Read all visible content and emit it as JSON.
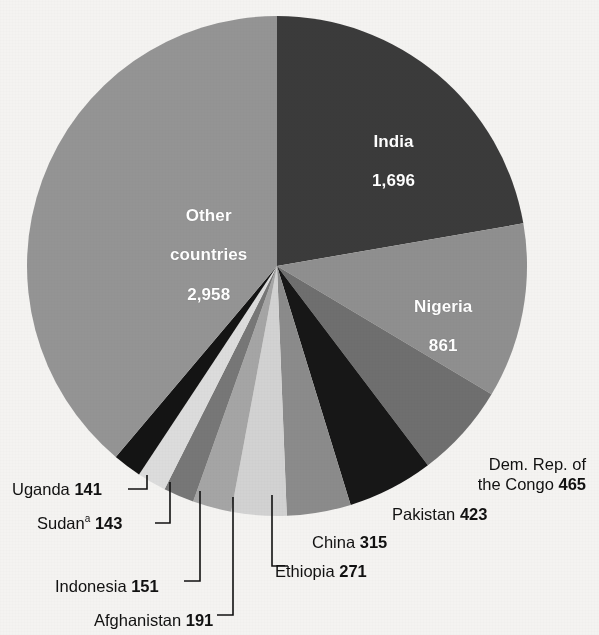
{
  "chart_data": {
    "type": "pie",
    "title": "",
    "subtitle": "",
    "unit": "",
    "total": 7615,
    "start_angle_deg": 0,
    "direction": "clockwise",
    "legend": "none",
    "labels_inside": [
      "India",
      "Nigeria",
      "Other countries"
    ],
    "categories": [
      "India",
      "Nigeria",
      "Dem. Rep. of the Congo",
      "Pakistan",
      "China",
      "Ethiopia",
      "Afghanistan",
      "Indonesia",
      "Sudan",
      "Uganda",
      "Other countries"
    ],
    "values": [
      1696,
      861,
      465,
      423,
      315,
      271,
      191,
      151,
      143,
      141,
      2958
    ],
    "slices": [
      {
        "id": "india",
        "name": "India",
        "value": 1696,
        "value_text": "1,696",
        "label_lines": [
          "India",
          "1,696"
        ],
        "color": "#3b3b3b",
        "label_placement": "inside",
        "label_color": "#ffffff",
        "label_x": 372,
        "label_y": 112,
        "angle_deg": 80.2
      },
      {
        "id": "nigeria",
        "name": "Nigeria",
        "value": 861,
        "value_text": "861",
        "label_lines": [
          "Nigeria",
          "861"
        ],
        "color": "#8f8f8f",
        "label_placement": "inside",
        "label_color": "#ffffff",
        "label_x": 414,
        "label_y": 277,
        "angle_deg": 40.7
      },
      {
        "id": "congo",
        "name": "Dem. Rep. of the Congo",
        "value": 465,
        "value_text": "465",
        "label_lines": [
          "Dem. Rep. of",
          "the Congo 465"
        ],
        "color": "#6f6f6f",
        "label_placement": "outside",
        "label_color": "#111111",
        "label_x": 456,
        "label_y": 455,
        "leader": false,
        "angle_deg": 22.0
      },
      {
        "id": "pakistan",
        "name": "Pakistan",
        "value": 423,
        "value_text": "423",
        "label_lines": [
          "Pakistan 423"
        ],
        "color": "#171717",
        "label_placement": "outside",
        "label_color": "#111111",
        "label_x": 392,
        "label_y": 505,
        "leader": false,
        "angle_deg": 20.0
      },
      {
        "id": "china",
        "name": "China",
        "value": 315,
        "value_text": "315",
        "label_lines": [
          "China 315"
        ],
        "color": "#8b8b8b",
        "label_placement": "outside",
        "label_color": "#111111",
        "label_x": 312,
        "label_y": 533,
        "leader": false,
        "angle_deg": 14.9
      },
      {
        "id": "ethiopia",
        "name": "Ethiopia",
        "value": 271,
        "value_text": "271",
        "label_lines": [
          "Ethiopia 271"
        ],
        "color": "#d2d2d2",
        "label_placement": "outside",
        "label_color": "#111111",
        "label_x": 275,
        "label_y": 562,
        "leader": true,
        "angle_deg": 12.8
      },
      {
        "id": "afghanistan",
        "name": "Afghanistan",
        "value": 191,
        "value_text": "191",
        "label_lines": [
          "Afghanistan 191"
        ],
        "color": "#a5a5a5",
        "label_placement": "outside",
        "label_color": "#111111",
        "label_x": 94,
        "label_y": 611,
        "leader": true,
        "angle_deg": 9.0
      },
      {
        "id": "indonesia",
        "name": "Indonesia",
        "value": 151,
        "value_text": "151",
        "label_lines": [
          "Indonesia 151"
        ],
        "color": "#777777",
        "label_placement": "outside",
        "label_color": "#111111",
        "label_x": 55,
        "label_y": 577,
        "leader": true,
        "angle_deg": 7.1
      },
      {
        "id": "sudan",
        "name": "Sudan",
        "name_superscript": "a",
        "value": 143,
        "value_text": "143",
        "label_lines": [
          "Sudan 143"
        ],
        "color": "#dcdcdc",
        "label_placement": "outside",
        "label_color": "#111111",
        "label_x": 37,
        "label_y": 513,
        "leader": true,
        "angle_deg": 6.8
      },
      {
        "id": "uganda",
        "name": "Uganda",
        "value": 141,
        "value_text": "141",
        "label_lines": [
          "Uganda 141"
        ],
        "color": "#141414",
        "label_placement": "outside",
        "label_color": "#111111",
        "label_x": 12,
        "label_y": 480,
        "leader": true,
        "angle_deg": 6.7
      },
      {
        "id": "other-countries",
        "name": "Other countries",
        "value": 2958,
        "value_text": "2,958",
        "label_lines": [
          "Other",
          "countries",
          "2,958"
        ],
        "color": "#949494",
        "label_placement": "inside",
        "label_color": "#ffffff",
        "label_x": 170,
        "label_y": 186,
        "angle_deg": 139.8
      }
    ],
    "geometry": {
      "center_x": 277,
      "center_y": 266,
      "radius": 250
    },
    "background_color": "#f4f3f1"
  },
  "labels": {
    "india_line1": "India",
    "india_line2": "1,696",
    "nigeria_line1": "Nigeria",
    "nigeria_line2": "861",
    "other_line1": "Other",
    "other_line2": "countries",
    "other_line3": "2,958",
    "congo_line1": "Dem. Rep. of",
    "congo_line2_text": "the Congo ",
    "congo_value": "465",
    "pakistan_text": "Pakistan ",
    "pakistan_value": "423",
    "china_text": "China ",
    "china_value": "315",
    "ethiopia_text": "Ethiopia ",
    "ethiopia_value": "271",
    "afghanistan_text": "Afghanistan ",
    "afghanistan_value": "191",
    "indonesia_text": "Indonesia ",
    "indonesia_value": "151",
    "sudan_text": "Sudan",
    "sudan_superscript": "a",
    "sudan_value": "143",
    "uganda_text": "Uganda ",
    "uganda_value": "141"
  }
}
